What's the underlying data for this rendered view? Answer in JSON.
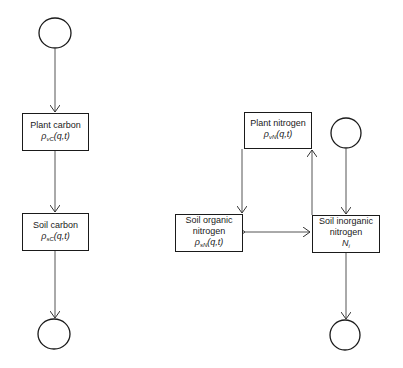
{
  "diagram": {
    "carbon": {
      "plant_carbon": {
        "label": "Plant carbon",
        "symbol": "ρ",
        "sub": "vC",
        "args": "(q,t)"
      },
      "soil_carbon": {
        "label": "Soil carbon",
        "symbol": "ρ",
        "sub": "sC",
        "args": "(q,t)"
      }
    },
    "nitrogen": {
      "plant_nitrogen": {
        "label": "Plant nitrogen",
        "symbol": "ρ",
        "sub": "vN",
        "args": "(q,t)"
      },
      "soil_organic_nitrogen": {
        "label1": "Soil organic",
        "label2": "nitrogen",
        "symbol": "ρ",
        "sub": "sN",
        "args": "(q,t)"
      },
      "soil_inorganic_nitrogen": {
        "label1": "Soil inorganic",
        "label2": "nitrogen",
        "symbol": "N",
        "sub": "i",
        "args": ""
      }
    },
    "colors": {
      "stroke": "#1a1a1a",
      "line": "#555555",
      "background": "#ffffff"
    }
  }
}
